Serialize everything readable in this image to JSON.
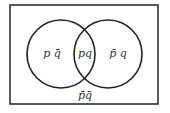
{
  "diagram": {
    "type": "venn",
    "universe": {
      "x": 10,
      "y": 5,
      "width": 148,
      "height": 99
    },
    "sets": [
      {
        "name": "p",
        "cx": 61,
        "cy": 54,
        "r": 34
      },
      {
        "name": "q",
        "cx": 108,
        "cy": 54,
        "r": 34
      }
    ],
    "regions": {
      "p_only": {
        "base": "p",
        "bar": "q̄",
        "text": "p q̄",
        "x": 52,
        "y": 57
      },
      "both": {
        "text": "pq",
        "x": 85,
        "y": 57
      },
      "q_only": {
        "text": "p̄ q",
        "x": 118,
        "y": 57
      },
      "neither": {
        "text": "p̄q̄",
        "x": 85,
        "y": 99
      }
    },
    "colors": {
      "stroke": "#222222",
      "text": "#333333",
      "background": "#ffffff"
    }
  }
}
